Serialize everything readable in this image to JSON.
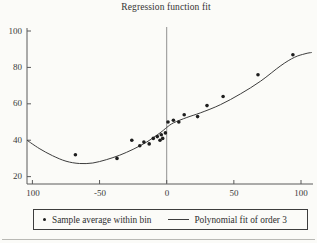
{
  "chart_data": {
    "type": "scatter",
    "title": "Regression function fit",
    "xlabel": "",
    "ylabel": "",
    "xlim": [
      -105,
      110
    ],
    "ylim": [
      18,
      104
    ],
    "grid": false,
    "legend_position": "bottom",
    "x_tick_values": [
      -100,
      -50,
      0,
      50,
      100
    ],
    "x_tick_labels": [
      "100",
      "-50",
      "0",
      "50",
      "100"
    ],
    "y_tick_values": [
      100,
      80,
      60,
      40,
      20
    ],
    "y_tick_labels": [
      "100",
      "80",
      "60",
      "40",
      "20"
    ],
    "reference_vline_x": 0,
    "series": [
      {
        "name": "Sample average within bin",
        "type": "scatter",
        "marker": "dot",
        "color": "#1e1e1e",
        "points": [
          [
            -68,
            32
          ],
          [
            -37,
            30
          ],
          [
            -26,
            40
          ],
          [
            -20,
            37
          ],
          [
            -17,
            39
          ],
          [
            -13,
            38
          ],
          [
            -10,
            41
          ],
          [
            -7,
            42
          ],
          [
            -5,
            40
          ],
          [
            -4,
            43
          ],
          [
            -3,
            41
          ],
          [
            -1,
            44
          ],
          [
            1,
            50
          ],
          [
            5,
            51
          ],
          [
            9,
            50
          ],
          [
            13,
            54
          ],
          [
            23,
            53
          ],
          [
            30,
            59
          ],
          [
            42,
            64
          ],
          [
            68,
            76
          ],
          [
            94,
            87
          ]
        ]
      },
      {
        "name": "Polynomial fit of order 3",
        "type": "line",
        "color": "#3d3d3d",
        "points": [
          [
            -104,
            40
          ],
          [
            -95,
            35.5
          ],
          [
            -85,
            31.5
          ],
          [
            -75,
            28.5
          ],
          [
            -65,
            27.2
          ],
          [
            -55,
            27.5
          ],
          [
            -45,
            29.3
          ],
          [
            -35,
            31.8
          ],
          [
            -25,
            35
          ],
          [
            -15,
            39
          ],
          [
            -5,
            44
          ],
          [
            0,
            47
          ],
          [
            5,
            49.5
          ],
          [
            15,
            52.5
          ],
          [
            25,
            55
          ],
          [
            40,
            59.5
          ],
          [
            55,
            65.5
          ],
          [
            70,
            72.5
          ],
          [
            85,
            81
          ],
          [
            95,
            85.5
          ],
          [
            103,
            87.5
          ],
          [
            108,
            88.2
          ]
        ]
      }
    ],
    "colors": {
      "background": "#fbfbf8",
      "axis": "#5a5a5a",
      "reference_line": "#909090"
    }
  }
}
